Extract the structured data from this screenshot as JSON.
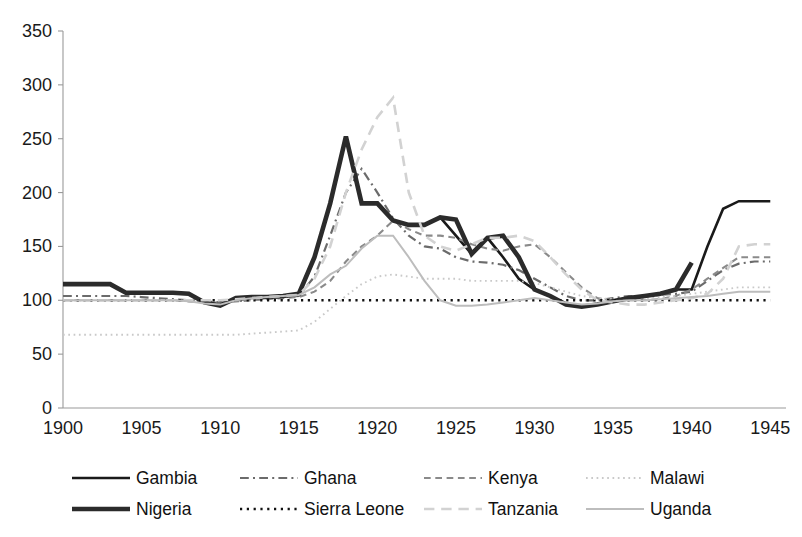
{
  "chart_data": {
    "type": "line",
    "title": "",
    "subtitle": "",
    "xlabel": "",
    "ylabel": "",
    "xlim": [
      1900,
      1946
    ],
    "ylim": [
      0,
      350
    ],
    "yticks": [
      0,
      50,
      100,
      150,
      200,
      250,
      300,
      350
    ],
    "xticks": [
      1900,
      1905,
      1910,
      1915,
      1920,
      1925,
      1930,
      1935,
      1940,
      1945
    ],
    "grid": false,
    "legend_position": "bottom",
    "legend_columns": 4,
    "x": [
      1900,
      1901,
      1902,
      1903,
      1904,
      1905,
      1906,
      1907,
      1908,
      1909,
      1910,
      1911,
      1912,
      1913,
      1914,
      1915,
      1916,
      1917,
      1918,
      1919,
      1920,
      1921,
      1922,
      1923,
      1924,
      1925,
      1926,
      1927,
      1928,
      1929,
      1930,
      1931,
      1932,
      1933,
      1934,
      1935,
      1936,
      1937,
      1938,
      1939,
      1940,
      1941,
      1942,
      1943,
      1944,
      1945
    ],
    "series": [
      {
        "name": "Gambia",
        "color": "#1a1a1a",
        "width": 2.6,
        "dash": "none",
        "values": [
          115,
          115,
          115,
          115,
          107,
          107,
          107,
          107,
          106,
          98,
          95,
          102,
          103,
          103,
          104,
          106,
          140,
          190,
          252,
          190,
          190,
          174,
          170,
          170,
          177,
          160,
          143,
          158,
          140,
          120,
          110,
          104,
          96,
          94,
          96,
          99,
          102,
          104,
          106,
          110,
          110,
          150,
          185,
          192,
          192,
          192
        ]
      },
      {
        "name": "Ghana",
        "color": "#6b6b6b",
        "width": 2.2,
        "dash": "dashdot",
        "values": [
          104,
          104,
          104,
          104,
          104,
          103,
          102,
          101,
          100,
          99,
          98,
          100,
          101,
          102,
          103,
          104,
          122,
          160,
          200,
          222,
          200,
          176,
          160,
          150,
          148,
          140,
          136,
          135,
          133,
          128,
          120,
          112,
          104,
          100,
          100,
          102,
          104,
          104,
          105,
          106,
          108,
          118,
          128,
          134,
          136,
          136
        ]
      },
      {
        "name": "Kenya",
        "color": "#8a8a8a",
        "width": 2.1,
        "dash": "dash",
        "values": [
          100,
          100,
          100,
          100,
          100,
          100,
          100,
          100,
          99,
          98,
          98,
          99,
          100,
          101,
          102,
          103,
          108,
          118,
          136,
          150,
          160,
          174,
          166,
          160,
          160,
          158,
          152,
          148,
          146,
          150,
          152,
          140,
          126,
          112,
          102,
          100,
          100,
          100,
          101,
          104,
          110,
          120,
          130,
          140,
          140,
          140
        ]
      },
      {
        "name": "Malawi",
        "color": "#c9c9c9",
        "width": 1.9,
        "dash": "dot",
        "values": [
          68,
          68,
          68,
          68,
          68,
          68,
          68,
          68,
          68,
          68,
          68,
          68,
          69,
          70,
          71,
          72,
          80,
          92,
          104,
          115,
          122,
          124,
          122,
          120,
          120,
          120,
          118,
          118,
          118,
          118,
          116,
          112,
          108,
          104,
          102,
          101,
          101,
          102,
          103,
          104,
          106,
          108,
          110,
          112,
          112,
          112
        ]
      },
      {
        "name": "Nigeria",
        "color": "#2b2b2b",
        "width": 4.6,
        "dash": "none",
        "values": [
          115,
          115,
          115,
          115,
          107,
          107,
          107,
          107,
          106,
          98,
          95,
          102,
          103,
          103,
          104,
          106,
          140,
          190,
          252,
          190,
          190,
          174,
          170,
          170,
          177,
          175,
          143,
          158,
          160,
          140,
          110,
          104,
          96,
          94,
          96,
          99,
          102,
          104,
          106,
          110,
          135,
          null,
          null,
          null,
          null,
          null
        ]
      },
      {
        "name": "Sierra Leone",
        "color": "#111111",
        "width": 2.4,
        "dash": "dot",
        "values": [
          100,
          100,
          100,
          100,
          100,
          100,
          100,
          100,
          100,
          100,
          100,
          100,
          100,
          100,
          100,
          100,
          100,
          100,
          100,
          100,
          100,
          100,
          100,
          100,
          100,
          100,
          100,
          100,
          100,
          100,
          100,
          100,
          100,
          100,
          100,
          100,
          100,
          100,
          100,
          100,
          100,
          100,
          100,
          100,
          100,
          100
        ]
      },
      {
        "name": "Tanzania",
        "color": "#d2d2d2",
        "width": 2.6,
        "dash": "longdash",
        "values": [
          100,
          100,
          100,
          100,
          100,
          100,
          100,
          100,
          100,
          100,
          100,
          101,
          102,
          103,
          104,
          105,
          120,
          150,
          200,
          240,
          270,
          288,
          200,
          160,
          150,
          146,
          152,
          158,
          158,
          160,
          155,
          140,
          124,
          110,
          100,
          98,
          96,
          96,
          98,
          100,
          102,
          106,
          120,
          150,
          152,
          152
        ]
      },
      {
        "name": "Uganda",
        "color": "#bdbdbd",
        "width": 2.0,
        "dash": "none",
        "values": [
          100,
          100,
          100,
          100,
          100,
          100,
          100,
          100,
          99,
          97,
          96,
          100,
          102,
          103,
          104,
          105,
          112,
          124,
          132,
          148,
          160,
          160,
          140,
          118,
          100,
          95,
          95,
          96,
          98,
          100,
          102,
          100,
          98,
          96,
          97,
          99,
          100,
          100,
          101,
          102,
          103,
          104,
          106,
          108,
          108,
          108
        ]
      }
    ]
  },
  "legend": {
    "items": [
      {
        "label": "Gambia"
      },
      {
        "label": "Ghana"
      },
      {
        "label": "Kenya"
      },
      {
        "label": "Malawi"
      },
      {
        "label": "Nigeria"
      },
      {
        "label": "Sierra Leone"
      },
      {
        "label": "Tanzania"
      },
      {
        "label": "Uganda"
      }
    ]
  }
}
